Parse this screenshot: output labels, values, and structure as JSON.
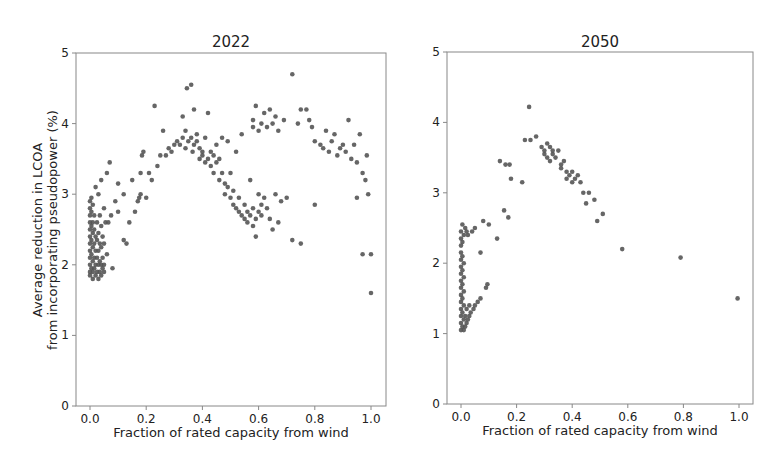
{
  "figure": {
    "left_title": "2022",
    "right_title": "2050",
    "ylabel_line1": "Average reduction in LCOA",
    "ylabel_line2": "from incorporating pseudopower (%)",
    "xlabel": "Fraction of rated capacity from wind",
    "x_ticks": [
      "0.0",
      "0.2",
      "0.4",
      "0.6",
      "0.8",
      "1.0"
    ],
    "y_ticks": [
      "0",
      "1",
      "2",
      "3",
      "4",
      "5"
    ],
    "point_color": "#555555"
  },
  "chart_data": [
    {
      "type": "scatter",
      "title": "2022",
      "xlabel": "Fraction of rated capacity from wind",
      "ylabel": "Average reduction in LCOA from incorporating pseudopower (%)",
      "xlim": [
        -0.05,
        1.05
      ],
      "ylim": [
        0,
        5
      ],
      "x_ticks": [
        0.0,
        0.2,
        0.4,
        0.6,
        0.8,
        1.0
      ],
      "y_ticks": [
        0,
        1,
        2,
        3,
        4,
        5
      ],
      "grid": false,
      "points": [
        [
          0.0,
          2.9
        ],
        [
          0.0,
          2.8
        ],
        [
          0.0,
          2.7
        ],
        [
          0.0,
          2.6
        ],
        [
          0.0,
          2.5
        ],
        [
          0.0,
          2.4
        ],
        [
          0.0,
          2.3
        ],
        [
          0.0,
          2.2
        ],
        [
          0.0,
          2.1
        ],
        [
          0.0,
          2.0
        ],
        [
          0.0,
          1.9
        ],
        [
          0.0,
          1.85
        ],
        [
          0.005,
          2.95
        ],
        [
          0.005,
          2.75
        ],
        [
          0.005,
          2.55
        ],
        [
          0.005,
          2.35
        ],
        [
          0.005,
          2.15
        ],
        [
          0.005,
          1.95
        ],
        [
          0.01,
          2.85
        ],
        [
          0.01,
          2.6
        ],
        [
          0.01,
          2.45
        ],
        [
          0.01,
          2.25
        ],
        [
          0.01,
          2.05
        ],
        [
          0.01,
          1.9
        ],
        [
          0.01,
          1.8
        ],
        [
          0.015,
          2.7
        ],
        [
          0.015,
          2.5
        ],
        [
          0.015,
          2.3
        ],
        [
          0.015,
          2.1
        ],
        [
          0.015,
          1.95
        ],
        [
          0.02,
          3.1
        ],
        [
          0.02,
          2.4
        ],
        [
          0.02,
          2.2
        ],
        [
          0.02,
          2.0
        ],
        [
          0.02,
          1.85
        ],
        [
          0.025,
          2.6
        ],
        [
          0.025,
          2.35
        ],
        [
          0.025,
          2.1
        ],
        [
          0.025,
          1.9
        ],
        [
          0.03,
          3.0
        ],
        [
          0.03,
          2.45
        ],
        [
          0.03,
          2.2
        ],
        [
          0.03,
          2.0
        ],
        [
          0.03,
          1.8
        ],
        [
          0.035,
          2.7
        ],
        [
          0.035,
          2.3
        ],
        [
          0.035,
          2.05
        ],
        [
          0.035,
          1.9
        ],
        [
          0.04,
          3.2
        ],
        [
          0.04,
          2.55
        ],
        [
          0.04,
          2.25
        ],
        [
          0.04,
          2.0
        ],
        [
          0.04,
          1.85
        ],
        [
          0.045,
          2.4
        ],
        [
          0.045,
          2.1
        ],
        [
          0.045,
          1.95
        ],
        [
          0.05,
          2.8
        ],
        [
          0.05,
          2.3
        ],
        [
          0.05,
          2.0
        ],
        [
          0.05,
          1.9
        ],
        [
          0.055,
          2.6
        ],
        [
          0.06,
          3.3
        ],
        [
          0.06,
          2.15
        ],
        [
          0.065,
          2.6
        ],
        [
          0.07,
          3.45
        ],
        [
          0.075,
          2.7
        ],
        [
          0.08,
          1.95
        ],
        [
          0.09,
          2.9
        ],
        [
          0.1,
          2.75
        ],
        [
          0.1,
          3.15
        ],
        [
          0.12,
          3.0
        ],
        [
          0.12,
          2.35
        ],
        [
          0.13,
          2.3
        ],
        [
          0.14,
          2.6
        ],
        [
          0.15,
          3.2
        ],
        [
          0.16,
          2.75
        ],
        [
          0.17,
          2.9
        ],
        [
          0.175,
          2.95
        ],
        [
          0.18,
          3.0
        ],
        [
          0.185,
          3.55
        ],
        [
          0.19,
          3.6
        ],
        [
          0.18,
          3.3
        ],
        [
          0.2,
          2.95
        ],
        [
          0.21,
          3.3
        ],
        [
          0.22,
          3.2
        ],
        [
          0.23,
          4.25
        ],
        [
          0.24,
          3.4
        ],
        [
          0.25,
          3.55
        ],
        [
          0.26,
          3.9
        ],
        [
          0.27,
          3.55
        ],
        [
          0.28,
          3.65
        ],
        [
          0.29,
          3.6
        ],
        [
          0.3,
          3.7
        ],
        [
          0.31,
          3.75
        ],
        [
          0.32,
          3.7
        ],
        [
          0.33,
          3.8
        ],
        [
          0.33,
          4.1
        ],
        [
          0.34,
          3.65
        ],
        [
          0.34,
          3.9
        ],
        [
          0.345,
          4.5
        ],
        [
          0.35,
          3.75
        ],
        [
          0.36,
          4.55
        ],
        [
          0.36,
          3.8
        ],
        [
          0.365,
          3.6
        ],
        [
          0.37,
          3.7
        ],
        [
          0.37,
          4.2
        ],
        [
          0.38,
          3.75
        ],
        [
          0.38,
          3.85
        ],
        [
          0.39,
          3.65
        ],
        [
          0.39,
          3.5
        ],
        [
          0.4,
          3.6
        ],
        [
          0.4,
          3.55
        ],
        [
          0.41,
          3.45
        ],
        [
          0.41,
          3.8
        ],
        [
          0.42,
          3.5
        ],
        [
          0.42,
          4.15
        ],
        [
          0.43,
          3.4
        ],
        [
          0.43,
          3.6
        ],
        [
          0.44,
          3.55
        ],
        [
          0.44,
          3.3
        ],
        [
          0.45,
          3.45
        ],
        [
          0.45,
          3.7
        ],
        [
          0.46,
          3.2
        ],
        [
          0.46,
          3.5
        ],
        [
          0.47,
          3.3
        ],
        [
          0.47,
          3.8
        ],
        [
          0.48,
          3.15
        ],
        [
          0.48,
          3.0
        ],
        [
          0.49,
          3.1
        ],
        [
          0.49,
          3.75
        ],
        [
          0.5,
          2.95
        ],
        [
          0.5,
          3.3
        ],
        [
          0.51,
          2.85
        ],
        [
          0.51,
          3.05
        ],
        [
          0.52,
          2.8
        ],
        [
          0.52,
          3.6
        ],
        [
          0.53,
          2.75
        ],
        [
          0.53,
          2.95
        ],
        [
          0.54,
          2.7
        ],
        [
          0.54,
          3.85
        ],
        [
          0.55,
          2.65
        ],
        [
          0.55,
          2.85
        ],
        [
          0.56,
          2.6
        ],
        [
          0.56,
          2.75
        ],
        [
          0.57,
          2.7
        ],
        [
          0.57,
          3.2
        ],
        [
          0.58,
          2.55
        ],
        [
          0.58,
          2.8
        ],
        [
          0.59,
          2.65
        ],
        [
          0.59,
          2.4
        ],
        [
          0.6,
          2.75
        ],
        [
          0.6,
          3.0
        ],
        [
          0.61,
          2.7
        ],
        [
          0.61,
          2.85
        ],
        [
          0.62,
          2.95
        ],
        [
          0.63,
          2.8
        ],
        [
          0.64,
          2.65
        ],
        [
          0.65,
          2.5
        ],
        [
          0.66,
          3.0
        ],
        [
          0.67,
          2.6
        ],
        [
          0.68,
          2.9
        ],
        [
          0.7,
          2.95
        ],
        [
          0.72,
          2.35
        ],
        [
          0.75,
          2.3
        ],
        [
          0.58,
          3.95
        ],
        [
          0.58,
          4.05
        ],
        [
          0.59,
          4.25
        ],
        [
          0.6,
          3.9
        ],
        [
          0.61,
          4.0
        ],
        [
          0.62,
          4.15
        ],
        [
          0.63,
          3.95
        ],
        [
          0.64,
          4.2
        ],
        [
          0.65,
          4.0
        ],
        [
          0.66,
          4.1
        ],
        [
          0.67,
          3.9
        ],
        [
          0.69,
          4.05
        ],
        [
          0.72,
          4.7
        ],
        [
          0.74,
          4.0
        ],
        [
          0.75,
          4.2
        ],
        [
          0.77,
          4.2
        ],
        [
          0.78,
          4.05
        ],
        [
          0.79,
          3.95
        ],
        [
          0.8,
          3.75
        ],
        [
          0.82,
          3.7
        ],
        [
          0.83,
          3.65
        ],
        [
          0.84,
          3.9
        ],
        [
          0.85,
          3.6
        ],
        [
          0.86,
          3.75
        ],
        [
          0.87,
          3.85
        ],
        [
          0.88,
          3.55
        ],
        [
          0.89,
          3.65
        ],
        [
          0.9,
          3.7
        ],
        [
          0.91,
          3.6
        ],
        [
          0.92,
          4.05
        ],
        [
          0.93,
          3.5
        ],
        [
          0.94,
          3.7
        ],
        [
          0.95,
          3.45
        ],
        [
          0.96,
          3.85
        ],
        [
          0.97,
          3.3
        ],
        [
          0.98,
          3.2
        ],
        [
          0.985,
          3.55
        ],
        [
          0.99,
          3.0
        ],
        [
          0.97,
          2.15
        ],
        [
          1.0,
          2.15
        ],
        [
          0.95,
          2.95
        ],
        [
          1.0,
          1.6
        ],
        [
          0.8,
          2.85
        ]
      ]
    },
    {
      "type": "scatter",
      "title": "2050",
      "xlabel": "Fraction of rated capacity from wind",
      "ylabel": "",
      "xlim": [
        -0.05,
        1.05
      ],
      "ylim": [
        0,
        5
      ],
      "x_ticks": [
        0.0,
        0.2,
        0.4,
        0.6,
        0.8,
        1.0
      ],
      "y_ticks": [
        0,
        1,
        2,
        3,
        4,
        5
      ],
      "grid": false,
      "points": [
        [
          0.0,
          1.05
        ],
        [
          0.0,
          1.15
        ],
        [
          0.0,
          1.25
        ],
        [
          0.0,
          1.35
        ],
        [
          0.0,
          1.45
        ],
        [
          0.0,
          1.55
        ],
        [
          0.0,
          1.65
        ],
        [
          0.0,
          1.75
        ],
        [
          0.0,
          1.85
        ],
        [
          0.0,
          1.95
        ],
        [
          0.0,
          2.05
        ],
        [
          0.0,
          2.15
        ],
        [
          0.0,
          2.25
        ],
        [
          0.0,
          2.35
        ],
        [
          0.0,
          2.45
        ],
        [
          0.005,
          1.1
        ],
        [
          0.005,
          1.3
        ],
        [
          0.005,
          1.5
        ],
        [
          0.005,
          1.7
        ],
        [
          0.005,
          1.9
        ],
        [
          0.005,
          2.1
        ],
        [
          0.005,
          2.3
        ],
        [
          0.005,
          2.55
        ],
        [
          0.01,
          1.05
        ],
        [
          0.01,
          1.2
        ],
        [
          0.01,
          1.4
        ],
        [
          0.01,
          1.6
        ],
        [
          0.01,
          1.8
        ],
        [
          0.01,
          2.0
        ],
        [
          0.01,
          2.4
        ],
        [
          0.015,
          1.1
        ],
        [
          0.015,
          1.25
        ],
        [
          0.015,
          2.5
        ],
        [
          0.02,
          1.15
        ],
        [
          0.02,
          1.35
        ],
        [
          0.02,
          2.45
        ],
        [
          0.025,
          1.2
        ],
        [
          0.025,
          2.4
        ],
        [
          0.03,
          1.25
        ],
        [
          0.03,
          1.4
        ],
        [
          0.035,
          1.3
        ],
        [
          0.04,
          2.45
        ],
        [
          0.045,
          1.35
        ],
        [
          0.05,
          1.4
        ],
        [
          0.05,
          2.5
        ],
        [
          0.06,
          1.45
        ],
        [
          0.07,
          1.5
        ],
        [
          0.07,
          2.15
        ],
        [
          0.08,
          2.6
        ],
        [
          0.09,
          1.65
        ],
        [
          0.095,
          1.7
        ],
        [
          0.1,
          2.55
        ],
        [
          0.13,
          2.35
        ],
        [
          0.14,
          3.45
        ],
        [
          0.155,
          2.75
        ],
        [
          0.16,
          3.4
        ],
        [
          0.17,
          2.65
        ],
        [
          0.175,
          3.4
        ],
        [
          0.18,
          3.2
        ],
        [
          0.22,
          3.15
        ],
        [
          0.23,
          3.75
        ],
        [
          0.245,
          4.22
        ],
        [
          0.25,
          3.75
        ],
        [
          0.27,
          3.8
        ],
        [
          0.29,
          3.65
        ],
        [
          0.3,
          3.6
        ],
        [
          0.3,
          3.55
        ],
        [
          0.31,
          3.7
        ],
        [
          0.31,
          3.5
        ],
        [
          0.32,
          3.65
        ],
        [
          0.32,
          3.45
        ],
        [
          0.33,
          3.6
        ],
        [
          0.33,
          3.55
        ],
        [
          0.34,
          3.5
        ],
        [
          0.35,
          3.6
        ],
        [
          0.36,
          3.4
        ],
        [
          0.36,
          3.35
        ],
        [
          0.37,
          3.45
        ],
        [
          0.38,
          3.2
        ],
        [
          0.38,
          3.3
        ],
        [
          0.39,
          3.25
        ],
        [
          0.4,
          3.15
        ],
        [
          0.4,
          3.3
        ],
        [
          0.41,
          3.2
        ],
        [
          0.42,
          3.25
        ],
        [
          0.43,
          3.15
        ],
        [
          0.44,
          3.0
        ],
        [
          0.45,
          2.85
        ],
        [
          0.46,
          3.0
        ],
        [
          0.48,
          2.9
        ],
        [
          0.49,
          2.6
        ],
        [
          0.51,
          2.7
        ],
        [
          0.58,
          2.2
        ],
        [
          0.79,
          2.08
        ],
        [
          0.995,
          1.5
        ]
      ]
    }
  ]
}
